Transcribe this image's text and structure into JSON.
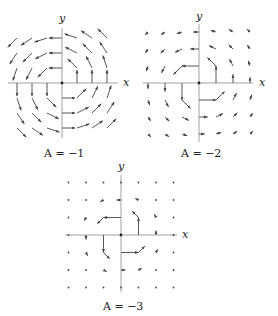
{
  "figure": {
    "colors": {
      "axis": "#8a8a8a",
      "arrow": "#444444",
      "text": "#222222"
    },
    "plots": [
      {
        "id": "plot-a-neg1",
        "caption": "A = −1",
        "A": -1,
        "x_label": "x",
        "y_label": "y",
        "origin": [
          62,
          83
        ],
        "spacing": 15,
        "grid_range": [
          -3,
          3
        ],
        "x_axis_extent": [
          8,
          118
        ],
        "y_axis_extent": [
          28,
          138
        ],
        "caption_pos": [
          62,
          157
        ],
        "x_label_pos": [
          126,
          86
        ],
        "y_label_pos": [
          62,
          22
        ],
        "arrow_scale": 13
      },
      {
        "id": "plot-a-neg2",
        "caption": "A = −2",
        "A": -2,
        "x_label": "x",
        "y_label": "y",
        "origin": [
          199,
          83
        ],
        "spacing": 17,
        "grid_range": [
          -3,
          3
        ],
        "x_axis_extent": [
          143,
          253
        ],
        "y_axis_extent": [
          24,
          142
        ],
        "caption_pos": [
          199,
          157
        ],
        "x_label_pos": [
          262,
          86
        ],
        "y_label_pos": [
          199,
          20
        ],
        "arrow_scale": 17
      },
      {
        "id": "plot-a-neg3",
        "caption": "A = −3",
        "A": -3,
        "x_label": "x",
        "y_label": "y",
        "origin": [
          121,
          235
        ],
        "spacing": 17.5,
        "grid_range": [
          -3,
          3
        ],
        "x_axis_extent": [
          65,
          177
        ],
        "y_axis_extent": [
          175,
          292
        ],
        "caption_pos": [
          121,
          310
        ],
        "x_label_pos": [
          185,
          238
        ],
        "y_label_pos": [
          121,
          170
        ],
        "arrow_scale": 17.5
      }
    ]
  }
}
